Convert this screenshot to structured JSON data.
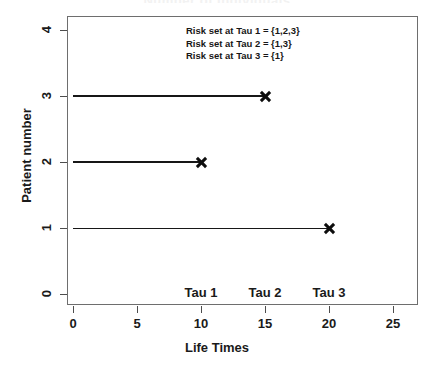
{
  "chart_data": {
    "type": "line",
    "title": "Number of Individuals",
    "xlabel": "Life Times",
    "ylabel": "Patient number",
    "xlim": [
      0,
      26
    ],
    "ylim": [
      0,
      4.2
    ],
    "grid": false,
    "legend": "none",
    "x_ticks": [
      0,
      5,
      10,
      15,
      20,
      25
    ],
    "x_tick_labels": [
      "0",
      "5",
      "10",
      "15",
      "20",
      "25"
    ],
    "y_ticks": [
      0,
      1,
      2,
      3,
      4
    ],
    "y_tick_labels": [
      "0",
      "1",
      "2",
      "3",
      "4"
    ],
    "series": [
      {
        "name": "Patient 1",
        "patient": 1,
        "start": 0,
        "end": 20,
        "event": true,
        "marker": "x",
        "linewidth": 1
      },
      {
        "name": "Patient 2",
        "patient": 2,
        "start": 0,
        "end": 10,
        "event": true,
        "marker": "x",
        "linewidth": 1.6
      },
      {
        "name": "Patient 3",
        "patient": 3,
        "start": 0,
        "end": 15,
        "event": true,
        "marker": "x",
        "linewidth": 2.6
      }
    ],
    "event_times": [
      {
        "label": "Tau 1",
        "time": 10
      },
      {
        "label": "Tau 2",
        "time": 15
      },
      {
        "label": "Tau 3",
        "time": 20
      }
    ],
    "annotations": [
      "Risk set at Tau 1 = {1,2,3}",
      "Risk set at Tau 2 = {1,3}",
      "Risk set at Tau 3 = {1}"
    ],
    "colors": {
      "line": "#171717",
      "marker": "#0d0d0d",
      "frame": "#6e6e6e",
      "text": "#1a1a1a",
      "background": "#ffffff"
    }
  }
}
